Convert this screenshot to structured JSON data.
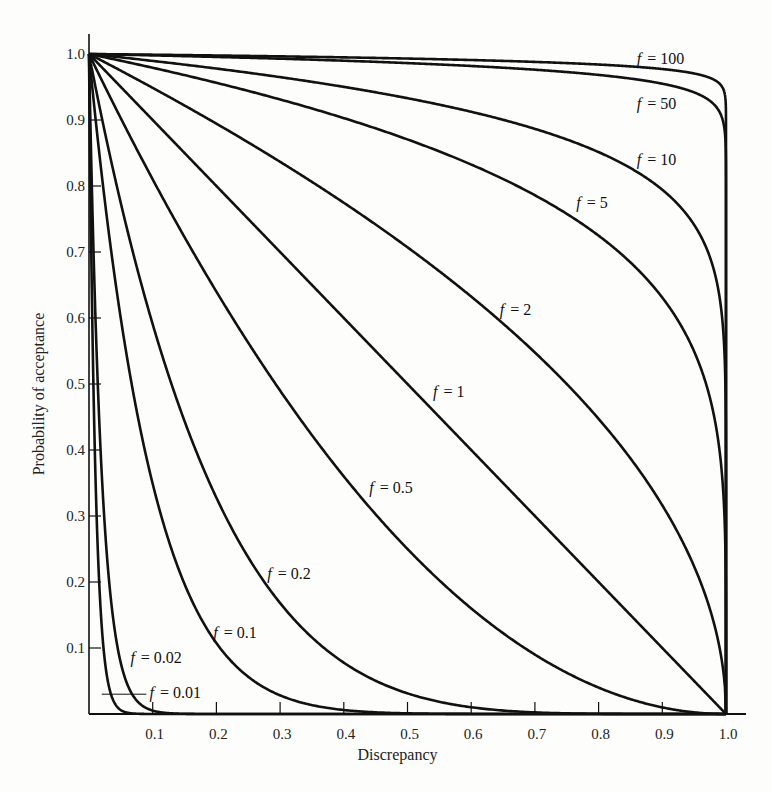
{
  "chart_data": {
    "type": "line",
    "title": "",
    "xlabel": "Discrepancy",
    "ylabel": "Probability of acceptance",
    "xlim": [
      0,
      1.0
    ],
    "ylim": [
      0,
      1.0
    ],
    "grid": false,
    "legend": "inline curve labels",
    "x_ticks": [
      "0.1",
      "0.2",
      "0.3",
      "0.4",
      "0.5",
      "0.6",
      "0.7",
      "0.8",
      "0.9",
      "1.0"
    ],
    "y_ticks": [
      "0.1",
      "0.2",
      "0.3",
      "0.4",
      "0.5",
      "0.6",
      "0.7",
      "0.8",
      "0.9",
      "1.0"
    ],
    "function": "Probability of acceptance = (1 - discrepancy)^(1/f)",
    "series": [
      {
        "name": "f = 100",
        "f": 100,
        "label": "= 100",
        "label_pos": [
          0.86,
          0.985
        ]
      },
      {
        "name": "f = 50",
        "f": 50,
        "label": "= 50",
        "label_pos": [
          0.86,
          0.917
        ]
      },
      {
        "name": "f = 10",
        "f": 10,
        "label": "= 10",
        "label_pos": [
          0.86,
          0.832
        ]
      },
      {
        "name": "f = 5",
        "f": 5,
        "label": "= 5",
        "label_pos": [
          0.765,
          0.767
        ]
      },
      {
        "name": "f = 2",
        "f": 2,
        "label": "= 2",
        "label_pos": [
          0.645,
          0.605
        ]
      },
      {
        "name": "f = 1",
        "f": 1,
        "label": "= 1",
        "label_pos": [
          0.54,
          0.48
        ]
      },
      {
        "name": "f = 0.5",
        "f": 0.5,
        "label": "= 0.5",
        "label_pos": [
          0.44,
          0.335
        ]
      },
      {
        "name": "f = 0.2",
        "f": 0.2,
        "label": "= 0.2",
        "label_pos": [
          0.28,
          0.205
        ]
      },
      {
        "name": "f = 0.1",
        "f": 0.1,
        "label": "= 0.1",
        "label_pos": [
          0.195,
          0.115
        ]
      },
      {
        "name": "f = 0.02",
        "f": 0.02,
        "label": "= 0.02",
        "label_pos": [
          0.065,
          0.078
        ]
      },
      {
        "name": "f = 0.01",
        "f": 0.01,
        "label": "= 0.01",
        "label_pos": [
          0.095,
          0.025
        ]
      }
    ],
    "sample_points": {
      "x": [
        0,
        0.1,
        0.2,
        0.3,
        0.4,
        0.5,
        0.6,
        0.7,
        0.8,
        0.9,
        1.0
      ],
      "f=1": [
        1.0,
        0.9,
        0.8,
        0.7,
        0.6,
        0.5,
        0.4,
        0.3,
        0.2,
        0.1,
        0.0
      ],
      "f=2": [
        1.0,
        0.95,
        0.89,
        0.84,
        0.77,
        0.71,
        0.63,
        0.55,
        0.45,
        0.32,
        0.0
      ],
      "f=0.5": [
        1.0,
        0.81,
        0.64,
        0.49,
        0.36,
        0.25,
        0.16,
        0.09,
        0.04,
        0.01,
        0.0
      ]
    }
  }
}
